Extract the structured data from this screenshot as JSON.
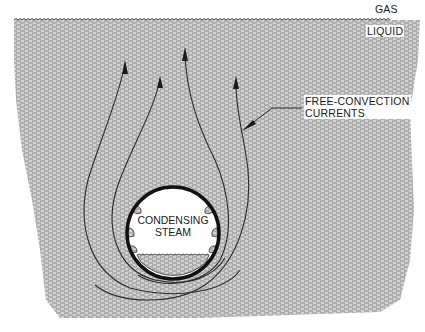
{
  "diagram": {
    "type": "free-convection condensation schematic",
    "regions": {
      "gas": {
        "label": "GAS"
      },
      "liquid": {
        "label": "LIQUID",
        "fill_color": "#b9b9b9"
      }
    },
    "pipe": {
      "label_line1": "CONDENSING",
      "label_line2": "STEAM",
      "wall_color": "#111111"
    },
    "currents": {
      "label_line1": "FREE-CONVECTION",
      "label_line2": "CURRENTS",
      "count": 4,
      "stroke_color": "#2a2a2a"
    }
  }
}
